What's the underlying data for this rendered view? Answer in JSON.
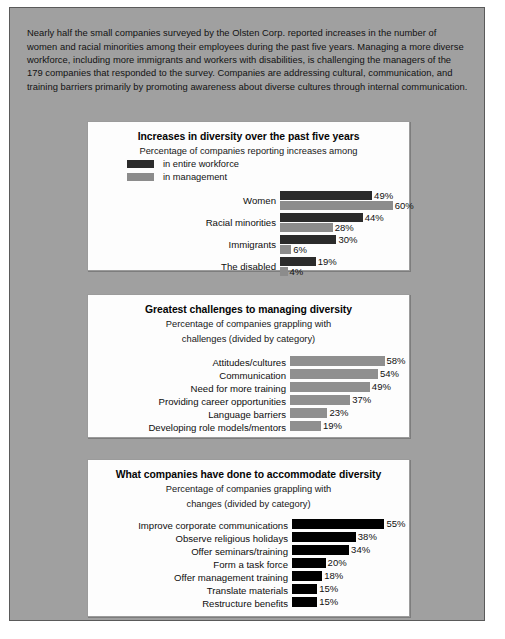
{
  "intro": {
    "text": "Nearly half the small companies surveyed by the Olsten Corp. reported increases in the number of women and racial minorities among their employees during the past five years. Managing a more diverse workforce, including more immigrants and workers with disabilities, is challenging the managers of the 179 companies that responded to the survey. Companies are addressing cultural, communication, and training barriers primarily by promoting awareness about diverse cultures through internal communication."
  },
  "colors": {
    "panel_background": "#a0a0a0",
    "card_background": "#fdfdfd",
    "series_entire_workforce": "#2b2b2b",
    "series_in_management": "#8c8c8c",
    "challenges_bar": "#8f8f8f",
    "accommodations_bar": "#000000"
  },
  "charts": [
    {
      "title": "Increases in diversity over the past five years",
      "subtitle_line1": "Percentage of companies reporting increases among",
      "subtitle_line2": "",
      "legend": [
        {
          "label": "in entire workforce",
          "color": "#2b2b2b"
        },
        {
          "label": "in management",
          "color": "#8c8c8c"
        }
      ],
      "groups": [
        {
          "label": "Women",
          "bars": [
            {
              "value": 49,
              "value_label": "49%",
              "series": "in entire workforce"
            },
            {
              "value": 60,
              "value_label": "60%",
              "series": "in management"
            }
          ]
        },
        {
          "label": "Racial minorities",
          "bars": [
            {
              "value": 44,
              "value_label": "44%",
              "series": "in entire workforce"
            },
            {
              "value": 28,
              "value_label": "28%",
              "series": "in management"
            }
          ]
        },
        {
          "label": "Immigrants",
          "bars": [
            {
              "value": 30,
              "value_label": "30%",
              "series": "in entire workforce"
            },
            {
              "value": 6,
              "value_label": "6%",
              "series": "in management"
            }
          ]
        },
        {
          "label": "The disabled",
          "bars": [
            {
              "value": 19,
              "value_label": "19%",
              "series": "in entire workforce"
            },
            {
              "value": 4,
              "value_label": "4%",
              "series": "in management"
            }
          ]
        }
      ]
    },
    {
      "title": "Greatest challenges to managing diversity",
      "subtitle_line1": "Percentage of companies grappling with",
      "subtitle_line2": "challenges (divided by category)",
      "legend": [],
      "groups": [
        {
          "label": "Attitudes/cultures",
          "bars": [
            {
              "value": 58,
              "value_label": "58%"
            }
          ]
        },
        {
          "label": "Communication",
          "bars": [
            {
              "value": 54,
              "value_label": "54%"
            }
          ]
        },
        {
          "label": "Need for more training",
          "bars": [
            {
              "value": 49,
              "value_label": "49%"
            }
          ]
        },
        {
          "label": "Providing career opportunities",
          "bars": [
            {
              "value": 37,
              "value_label": "37%"
            }
          ]
        },
        {
          "label": "Language barriers",
          "bars": [
            {
              "value": 23,
              "value_label": "23%"
            }
          ]
        },
        {
          "label": "Developing role models/mentors",
          "bars": [
            {
              "value": 19,
              "value_label": "19%"
            }
          ]
        }
      ]
    },
    {
      "title": "What companies have done to accommodate diversity",
      "subtitle_line1": "Percentage of companies grappling with",
      "subtitle_line2": "changes (divided by category)",
      "legend": [],
      "groups": [
        {
          "label": "Improve corporate communications",
          "bars": [
            {
              "value": 55,
              "value_label": "55%"
            }
          ]
        },
        {
          "label": "Observe religious holidays",
          "bars": [
            {
              "value": 38,
              "value_label": "38%"
            }
          ]
        },
        {
          "label": "Offer seminars/training",
          "bars": [
            {
              "value": 34,
              "value_label": "34%"
            }
          ]
        },
        {
          "label": "Form a task force",
          "bars": [
            {
              "value": 20,
              "value_label": "20%"
            }
          ]
        },
        {
          "label": "Offer management training",
          "bars": [
            {
              "value": 18,
              "value_label": "18%"
            }
          ]
        },
        {
          "label": "Translate materials",
          "bars": [
            {
              "value": 15,
              "value_label": "15%"
            }
          ]
        },
        {
          "label": "Restructure benefits",
          "bars": [
            {
              "value": 15,
              "value_label": "15%"
            }
          ]
        }
      ]
    }
  ],
  "chart_data": [
    {
      "type": "bar",
      "orientation": "horizontal",
      "title": "Increases in diversity over the past five years",
      "subtitle": "Percentage of companies reporting increases among",
      "categories": [
        "Women",
        "Racial minorities",
        "Immigrants",
        "The disabled"
      ],
      "series": [
        {
          "name": "in entire workforce",
          "values": [
            49,
            44,
            30,
            19
          ],
          "color": "#2b2b2b"
        },
        {
          "name": "in management",
          "values": [
            60,
            28,
            6,
            4
          ],
          "color": "#8c8c8c"
        }
      ],
      "xlabel": "",
      "ylabel": "",
      "xlim": [
        0,
        60
      ],
      "unit": "%",
      "grid": false,
      "legend_position": "top-left",
      "data_labels": true
    },
    {
      "type": "bar",
      "orientation": "horizontal",
      "title": "Greatest challenges to managing diversity",
      "subtitle": "Percentage of companies grappling with challenges (divided by category)",
      "categories": [
        "Attitudes/cultures",
        "Communication",
        "Need for more training",
        "Providing career opportunities",
        "Language barriers",
        "Developing role models/mentors"
      ],
      "values": [
        58,
        54,
        49,
        37,
        23,
        19
      ],
      "color": "#8f8f8f",
      "xlabel": "",
      "ylabel": "",
      "xlim": [
        0,
        58
      ],
      "unit": "%",
      "grid": false,
      "legend_position": "none",
      "data_labels": true
    },
    {
      "type": "bar",
      "orientation": "horizontal",
      "title": "What companies have done to accommodate diversity",
      "subtitle": "Percentage of companies grappling with changes (divided by category)",
      "categories": [
        "Improve corporate communications",
        "Observe religious holidays",
        "Offer seminars/training",
        "Form a task force",
        "Offer management training",
        "Translate materials",
        "Restructure benefits"
      ],
      "values": [
        55,
        38,
        34,
        20,
        18,
        15,
        15
      ],
      "color": "#000000",
      "xlabel": "",
      "ylabel": "",
      "xlim": [
        0,
        55
      ],
      "unit": "%",
      "grid": false,
      "legend_position": "none",
      "data_labels": true
    }
  ]
}
